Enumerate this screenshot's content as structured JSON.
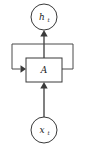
{
  "diagram": {
    "background_color": "#ffffff",
    "stroke_color": "#3a3a3a",
    "edge_color": "#4a4a4a",
    "text_color": "#1a1a1a",
    "nodes": {
      "output": {
        "shape": "circle",
        "symbol": "h",
        "subscript": "t",
        "label": "h_t",
        "cx": 44,
        "cy": 17,
        "r": 13
      },
      "cell": {
        "shape": "rectangle",
        "symbol": "A",
        "label": "A",
        "x": 26,
        "y": 58,
        "width": 36,
        "height": 24
      },
      "input": {
        "shape": "circle",
        "symbol": "x",
        "subscript": "t",
        "label": "x_t",
        "cx": 44,
        "cy": 130,
        "r": 13
      }
    },
    "edges": [
      {
        "name": "input-to-cell",
        "from": "input",
        "to": "cell",
        "direction": "up",
        "arrow": true
      },
      {
        "name": "cell-to-output",
        "from": "cell",
        "to": "output",
        "direction": "up",
        "arrow": true
      },
      {
        "name": "recurrent-loop",
        "from": "cell-right",
        "to": "cell-left",
        "direction": "right-up-left-down-right",
        "arrow": true
      }
    ]
  }
}
